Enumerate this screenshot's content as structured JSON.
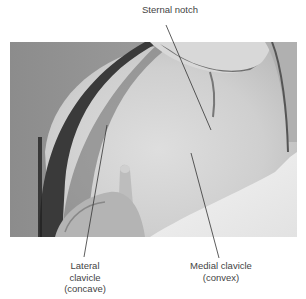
{
  "figure": {
    "type": "anatomical-photo",
    "colors": {
      "background": "#ffffff",
      "label_text": "#444444",
      "leader_line": "#333333"
    },
    "labels": [
      {
        "id": "sternal-notch",
        "lines": [
          "Sternal notch"
        ]
      },
      {
        "id": "lateral-clavicle",
        "lines": [
          "Lateral",
          "clavicle",
          "(concave)"
        ]
      },
      {
        "id": "medial-clavicle",
        "lines": [
          "Medial clavicle",
          "(convex)"
        ]
      }
    ]
  }
}
